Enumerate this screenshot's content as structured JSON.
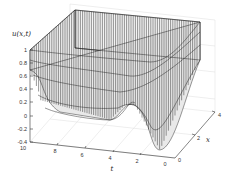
{
  "chart_data": {
    "type": "surface",
    "title": "",
    "zlabel": "u(x,t)",
    "xlabel": "t",
    "ylabel": "x",
    "t_ticks": [
      "10",
      "8",
      "6",
      "4",
      "2",
      "0"
    ],
    "x_ticks": [
      "0",
      "2",
      "4"
    ],
    "z_ticks": [
      "1",
      "0.8",
      "0.6",
      "0.4",
      "0.2",
      "0",
      "-0.2",
      "-0.4"
    ],
    "t_range": [
      0,
      10
    ],
    "x_range": [
      0,
      4
    ],
    "z_range": [
      -0.4,
      1
    ],
    "grid": true,
    "style": "mesh wireframe, black lines on white"
  },
  "colors": {
    "mesh": "#1a1a1a",
    "grid": "#d9d9d9",
    "axes": "#333333",
    "background": "#ffffff"
  }
}
